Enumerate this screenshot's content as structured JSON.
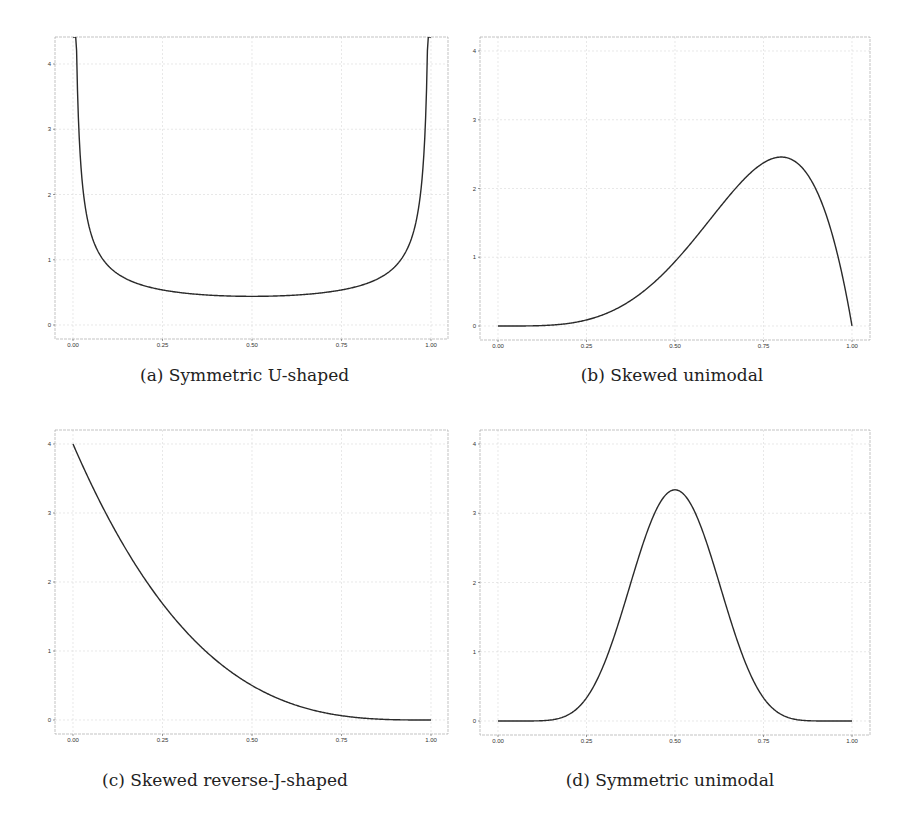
{
  "figure": {
    "panels": [
      {
        "id": "a",
        "caption": "(a) Symmetric U-shaped"
      },
      {
        "id": "b",
        "caption": "(b) Skewed unimodal"
      },
      {
        "id": "c",
        "caption": "(c) Skewed reverse-J-shaped"
      },
      {
        "id": "d",
        "caption": "(d) Symmetric unimodal"
      }
    ]
  },
  "chart_data": [
    {
      "type": "line",
      "title": "(a) Symmetric U-shaped",
      "xlabel": "",
      "ylabel": "",
      "xlim": [
        0,
        1
      ],
      "ylim": [
        -0.2,
        4.4
      ],
      "xticks": [
        "0.00",
        "0.25",
        "0.50",
        "0.75",
        "1.00"
      ],
      "yticks": [
        "0",
        "1",
        "2",
        "3",
        "4"
      ],
      "grid": true,
      "series": [
        {
          "name": "density",
          "dist": "beta",
          "alpha": 0.3,
          "beta": 0.3,
          "x": [
            0.01,
            0.02,
            0.05,
            0.1,
            0.25,
            0.5,
            0.75,
            0.9,
            0.95,
            0.98,
            0.99
          ],
          "y": [
            4.3,
            2.5,
            1.3,
            0.85,
            0.53,
            0.45,
            0.53,
            0.85,
            1.3,
            2.5,
            4.3
          ]
        }
      ]
    },
    {
      "type": "line",
      "title": "(b) Skewed unimodal",
      "xlabel": "",
      "ylabel": "",
      "xlim": [
        0,
        1
      ],
      "ylim": [
        -0.2,
        4.2
      ],
      "xticks": [
        "0.00",
        "0.25",
        "0.50",
        "0.75",
        "1.00"
      ],
      "yticks": [
        "0",
        "1",
        "2",
        "3",
        "4"
      ],
      "grid": true,
      "series": [
        {
          "name": "density",
          "dist": "beta",
          "alpha": 5,
          "beta": 2,
          "x": [
            0,
            0.25,
            0.5,
            0.6,
            0.7,
            0.8,
            0.9,
            1.0
          ],
          "y": [
            0,
            0.09,
            0.94,
            1.56,
            2.16,
            2.46,
            1.97,
            0
          ]
        }
      ]
    },
    {
      "type": "line",
      "title": "(c) Skewed reverse-J-shaped",
      "xlabel": "",
      "ylabel": "",
      "xlim": [
        0,
        1
      ],
      "ylim": [
        -0.2,
        4.2
      ],
      "xticks": [
        "0.00",
        "0.25",
        "0.50",
        "0.75",
        "1.00"
      ],
      "yticks": [
        "0",
        "1",
        "2",
        "3",
        "4"
      ],
      "grid": true,
      "series": [
        {
          "name": "density",
          "dist": "beta",
          "alpha": 1,
          "beta": 4,
          "x": [
            0,
            0.1,
            0.25,
            0.5,
            0.75,
            1.0
          ],
          "y": [
            4.0,
            2.92,
            1.69,
            0.5,
            0.06,
            0
          ]
        }
      ]
    },
    {
      "type": "line",
      "title": "(d) Symmetric unimodal",
      "xlabel": "",
      "ylabel": "",
      "xlim": [
        0,
        1
      ],
      "ylim": [
        -0.2,
        4.2
      ],
      "xticks": [
        "0.00",
        "0.25",
        "0.50",
        "0.75",
        "1.00"
      ],
      "yticks": [
        "0",
        "1",
        "2",
        "3",
        "4"
      ],
      "grid": true,
      "series": [
        {
          "name": "density",
          "dist": "beta",
          "alpha": 9,
          "beta": 9,
          "x": [
            0,
            0.2,
            0.25,
            0.35,
            0.5,
            0.65,
            0.75,
            0.8,
            1.0
          ],
          "y": [
            0,
            0.08,
            0.3,
            1.55,
            3.34,
            1.55,
            0.3,
            0.08,
            0
          ]
        }
      ]
    }
  ]
}
